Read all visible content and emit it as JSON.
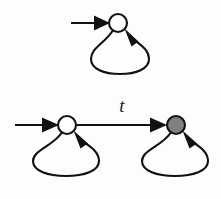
{
  "figure": {
    "kind": "state-transition-diagram",
    "title": "",
    "background_color": "#fdfdfd",
    "stroke_color": "#111111",
    "accent_fill_color": "#808080",
    "hollow_fill_color": "#ffffff"
  },
  "automata": [
    {
      "id": "upper",
      "name": "upper-automaton",
      "states": [
        {
          "id": "upper-q0",
          "label": "",
          "name": "state-upper-initial",
          "fill": "hollow",
          "cx": 118,
          "cy": 23,
          "r": 9,
          "initial": true,
          "accepting": false,
          "self_loop": true
        }
      ],
      "transitions": [],
      "initial_arrow": {
        "name": "initial-arrow-upper",
        "from_x": 71,
        "to_x": 109,
        "y": 23,
        "label": ""
      }
    },
    {
      "id": "lower",
      "name": "lower-automaton",
      "states": [
        {
          "id": "lower-q0",
          "label": "",
          "name": "state-lower-initial",
          "fill": "hollow",
          "cx": 67,
          "cy": 125,
          "r": 9,
          "initial": true,
          "accepting": false,
          "self_loop": true
        },
        {
          "id": "lower-q1",
          "label": "",
          "name": "state-lower-target",
          "fill": "gray",
          "cx": 176,
          "cy": 125,
          "r": 9,
          "initial": false,
          "accepting": true,
          "self_loop": true
        }
      ],
      "transitions": [
        {
          "id": "t-lower",
          "name": "transition-t",
          "from": "lower-q0",
          "to": "lower-q1",
          "label": "t",
          "label_x": 122,
          "label_y": 112
        }
      ],
      "initial_arrow": {
        "name": "initial-arrow-lower",
        "from_x": 15,
        "to_x": 58,
        "y": 125,
        "label": ""
      }
    }
  ],
  "self_loops": [
    {
      "name": "self-loop-upper",
      "state": "upper-q0",
      "label": "",
      "left_x": 91,
      "right_x": 149,
      "bottom_y": 72
    },
    {
      "name": "self-loop-lower-left",
      "state": "lower-q0",
      "label": "",
      "left_x": 33,
      "right_x": 99,
      "bottom_y": 173
    },
    {
      "name": "self-loop-lower-right",
      "state": "lower-q1",
      "label": "",
      "left_x": 142,
      "right_x": 208,
      "bottom_y": 173
    }
  ]
}
